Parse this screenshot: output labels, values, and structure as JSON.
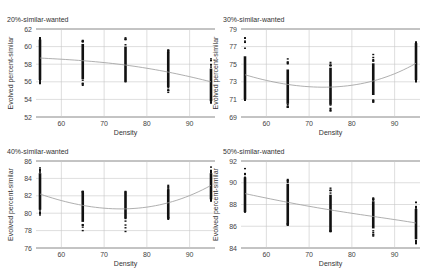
{
  "chart_data": [
    {
      "type": "scatter",
      "title": "20%-similar-wanted",
      "xlabel": "Density",
      "ylabel": "Evolved percent-similar",
      "xlim": [
        55,
        95
      ],
      "ylim": [
        52,
        62
      ],
      "xticks": [
        60,
        70,
        80,
        90
      ],
      "yticks": [
        52,
        54,
        56,
        58,
        60,
        62
      ],
      "grid": true,
      "series": [
        {
          "name": "runs",
          "x": [
            55,
            65,
            75,
            85,
            95
          ],
          "y_min": [
            55.8,
            55.6,
            56.0,
            54.8,
            53.6
          ],
          "y_max": [
            61.0,
            60.7,
            61.0,
            59.6,
            58.6
          ],
          "y_dense_min": [
            56.2,
            56.3,
            56.0,
            55.4,
            53.8
          ],
          "y_dense_max": [
            60.8,
            60.3,
            60.0,
            59.4,
            57.5
          ]
        },
        {
          "name": "fit",
          "x": [
            55,
            65,
            75,
            85,
            95
          ],
          "y": [
            58.7,
            58.4,
            57.9,
            57.1,
            56.0
          ]
        }
      ]
    },
    {
      "type": "scatter",
      "title": "30%-similar-wanted",
      "xlabel": "Density",
      "ylabel": "Evolved percent-similar",
      "xlim": [
        55,
        95
      ],
      "ylim": [
        69,
        79
      ],
      "xticks": [
        60,
        70,
        80,
        90
      ],
      "yticks": [
        69,
        71,
        73,
        75,
        77,
        79
      ],
      "grid": true,
      "series": [
        {
          "name": "runs",
          "x": [
            55,
            65,
            75,
            85,
            95
          ],
          "y_min": [
            70.9,
            70.1,
            69.7,
            70.7,
            73.0
          ],
          "y_max": [
            78.0,
            75.6,
            75.2,
            76.1,
            77.5
          ],
          "y_dense_min": [
            71.0,
            70.5,
            70.4,
            71.5,
            73.2
          ],
          "y_dense_max": [
            75.9,
            74.4,
            74.6,
            75.1,
            77.4
          ]
        },
        {
          "name": "fit",
          "x": [
            55,
            65,
            75,
            85,
            95
          ],
          "y": [
            73.8,
            72.7,
            72.4,
            73.1,
            75.1
          ]
        }
      ]
    },
    {
      "type": "scatter",
      "title": "40%-similar-wanted",
      "xlabel": "Density",
      "ylabel": "Evolved percent-similar",
      "xlim": [
        55,
        95
      ],
      "ylim": [
        76,
        86
      ],
      "xticks": [
        60,
        70,
        80,
        90
      ],
      "yticks": [
        76,
        78,
        80,
        82,
        84,
        86
      ],
      "grid": true,
      "series": [
        {
          "name": "runs",
          "x": [
            55,
            65,
            75,
            85,
            95
          ],
          "y_min": [
            79.8,
            78.0,
            77.9,
            79.3,
            81.4
          ],
          "y_max": [
            85.2,
            82.5,
            82.5,
            83.2,
            85.3
          ],
          "y_dense_min": [
            80.4,
            79.0,
            79.4,
            79.5,
            81.6
          ],
          "y_dense_max": [
            84.6,
            82.4,
            82.5,
            82.7,
            84.6
          ]
        },
        {
          "name": "fit",
          "x": [
            55,
            65,
            75,
            85,
            95
          ],
          "y": [
            82.2,
            80.9,
            80.5,
            81.2,
            83.2
          ]
        }
      ]
    },
    {
      "type": "scatter",
      "title": "50%-similar-wanted",
      "xlabel": "Density",
      "ylabel": "Evolved percent-similar",
      "xlim": [
        55,
        95
      ],
      "ylim": [
        84,
        92
      ],
      "xticks": [
        60,
        70,
        80,
        90
      ],
      "yticks": [
        84,
        86,
        88,
        90,
        92
      ],
      "grid": true,
      "series": [
        {
          "name": "runs",
          "x": [
            55,
            65,
            75,
            85,
            95
          ],
          "y_min": [
            87.3,
            86.1,
            85.5,
            85.1,
            84.4
          ],
          "y_max": [
            91.3,
            90.3,
            89.5,
            88.6,
            88.2
          ],
          "y_dense_min": [
            87.3,
            86.2,
            85.6,
            85.8,
            84.8
          ],
          "y_dense_max": [
            90.5,
            89.9,
            88.9,
            88.3,
            87.6
          ]
        },
        {
          "name": "fit",
          "x": [
            55,
            65,
            75,
            85,
            95
          ],
          "y": [
            89.0,
            88.2,
            87.5,
            86.9,
            86.3
          ]
        }
      ]
    }
  ],
  "panels_layout": [
    {
      "left": 40,
      "right": 211,
      "top": 29,
      "bottom": 117,
      "title_x": 7,
      "title_y": 22
    },
    {
      "left": 245,
      "right": 416,
      "top": 29,
      "bottom": 117,
      "title_x": 223,
      "title_y": 22
    },
    {
      "left": 40,
      "right": 211,
      "top": 161,
      "bottom": 248,
      "title_x": 7,
      "title_y": 154
    },
    {
      "left": 245,
      "right": 416,
      "top": 161,
      "bottom": 248,
      "title_x": 223,
      "title_y": 154
    }
  ]
}
